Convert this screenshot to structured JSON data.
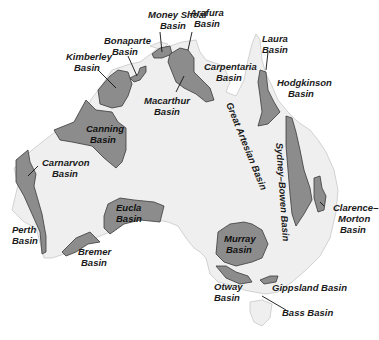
{
  "map": {
    "title": "Sedimentary Basins of Australia",
    "colors": {
      "land": "#efefef",
      "basin": "#8c8c8c",
      "outline": "#3a3a3a",
      "background": "#ffffff"
    },
    "labels": {
      "money_shoal": [
        "Money Shoal",
        "Basin"
      ],
      "arafura": [
        "Arafura",
        "Basin"
      ],
      "bonaparte": [
        "Bonaparte",
        "Basin"
      ],
      "laura": [
        "Laura",
        "Basin"
      ],
      "kimberley": [
        "Kimberley",
        "Basin"
      ],
      "carpentaria": [
        "Carpentaria",
        "Basin"
      ],
      "hodgkinson": [
        "Hodgkinson",
        "Basin"
      ],
      "macarthur": [
        "Macarthur",
        "Basin"
      ],
      "canning": [
        "Canning",
        "Basin"
      ],
      "great_artesian": "Great Artesian Basin",
      "sydney_bowen": "Sydney–Bowen Basin",
      "carnarvon": [
        "Carnarvon",
        "Basin"
      ],
      "clarence_moreton": [
        "Clarence–",
        "Morton",
        "Basin"
      ],
      "perth": [
        "Perth",
        "Basin"
      ],
      "eucla": [
        "Eucla",
        "Basin"
      ],
      "murray": [
        "Murray",
        "Basin"
      ],
      "bremer": [
        "Bremer",
        "Basin"
      ],
      "otway": [
        "Otway",
        "Basin"
      ],
      "gippsland": "Gippsland Basin",
      "bass": "Bass Basin"
    }
  }
}
